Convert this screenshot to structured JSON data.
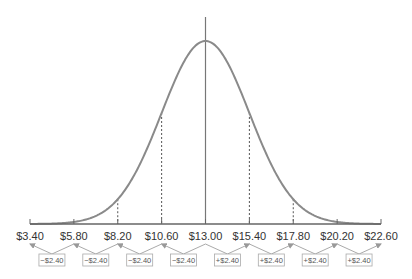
{
  "chart_data": {
    "type": "line",
    "title": "",
    "xlabel": "",
    "ylabel": "",
    "mean": 13.0,
    "std_dev": 2.4,
    "x_ticks": [
      "$3.40",
      "$5.80",
      "$8.20",
      "$10.60",
      "$13.00",
      "$15.40",
      "$17.80",
      "$20.20",
      "$22.60"
    ],
    "x_values": [
      3.4,
      5.8,
      8.2,
      10.6,
      13.0,
      15.4,
      17.8,
      20.2,
      22.6
    ],
    "xlim": [
      3.4,
      22.6
    ],
    "grid": false,
    "mean_line": {
      "x": 13.0,
      "style": "solid"
    },
    "sigma_lines": [
      {
        "x": 8.2,
        "style": "dashed"
      },
      {
        "x": 10.6,
        "style": "dashed"
      },
      {
        "x": 15.4,
        "style": "dashed"
      },
      {
        "x": 17.8,
        "style": "dashed"
      }
    ],
    "annotations": [
      {
        "text": "−$2.40",
        "from": "$5.80",
        "to": "$3.40"
      },
      {
        "text": "−$2.40",
        "from": "$8.20",
        "to": "$5.80"
      },
      {
        "text": "−$2.40",
        "from": "$10.60",
        "to": "$8.20"
      },
      {
        "text": "−$2.40",
        "from": "$13.00",
        "to": "$10.60"
      },
      {
        "text": "+$2.40",
        "from": "$13.00",
        "to": "$15.40"
      },
      {
        "text": "+$2.40",
        "from": "$15.40",
        "to": "$17.80"
      },
      {
        "text": "+$2.40",
        "from": "$17.80",
        "to": "$20.20"
      },
      {
        "text": "+$2.40",
        "from": "$20.20",
        "to": "$22.60"
      }
    ]
  },
  "colors": {
    "curve": "#8a8a8a",
    "axis": "#666666",
    "label": "#333333",
    "box_border": "#aaaaaa"
  }
}
